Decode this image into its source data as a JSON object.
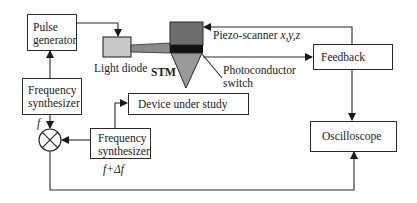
{
  "diagram": {
    "type": "block-diagram",
    "blocks": {
      "pulse_generator": {
        "line1": "Pulse",
        "line2": "generator"
      },
      "light_diode": {
        "label": "Light diode"
      },
      "stm": {
        "label": "STM"
      },
      "piezo_scanner": {
        "label": "Piezo-scanner ",
        "axes": "x,y,z"
      },
      "photoconductor_switch": {
        "line1": "Photoconductor",
        "line2": "switch"
      },
      "feedback": {
        "label": "Feedback"
      },
      "frequency_synthesizer_1": {
        "line1": "Frequency",
        "line2": "synthesizer",
        "output": "f"
      },
      "frequency_synthesizer_2": {
        "line1": "Frequency",
        "line2": "synthesizer",
        "output": "f+Δf"
      },
      "device_under_study": {
        "label": "Device under study"
      },
      "oscilloscope": {
        "label": "Oscilloscope"
      },
      "mixer": {
        "symbol": "⊗"
      }
    },
    "connections": [
      {
        "from": "Pulse generator",
        "to": "Light diode"
      },
      {
        "from": "Light diode",
        "to": "STM",
        "kind": "light beam"
      },
      {
        "from": "Feedback",
        "to": "STM",
        "label": "Piezo-scanner x,y,z"
      },
      {
        "from": "STM",
        "to": "Feedback"
      },
      {
        "from": "Feedback",
        "to": "Oscilloscope"
      },
      {
        "from": "Frequency synthesizer (f)",
        "to": "Pulse generator"
      },
      {
        "from": "Frequency synthesizer (f)",
        "to": "Mixer"
      },
      {
        "from": "Frequency synthesizer (f+Δf)",
        "to": "Mixer"
      },
      {
        "from": "Frequency synthesizer (f+Δf)",
        "to": "Device under study"
      },
      {
        "from": "Mixer",
        "to": "Oscilloscope"
      }
    ]
  },
  "colors": {
    "line": "#2a2a2a",
    "light_diode_fill": "#c8c8c8",
    "beam_fill": "#8a8a8a",
    "stm_body_fill": "#6e6e6e",
    "stm_band_fill": "#111111",
    "stm_tip_fill": "#9a9a9a"
  }
}
